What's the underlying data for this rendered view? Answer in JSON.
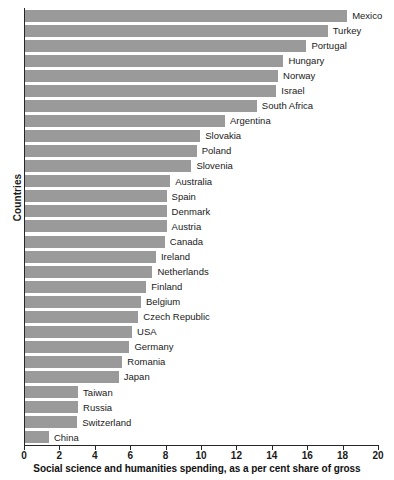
{
  "chart_data": {
    "type": "bar",
    "orientation": "horizontal",
    "title": "",
    "xlabel": "Social science and humanities spending, as a per cent share of gross",
    "ylabel": "Countries",
    "xlim": [
      0,
      20
    ],
    "xticks": [
      0,
      2,
      4,
      6,
      8,
      10,
      12,
      14,
      16,
      18,
      20
    ],
    "grid": false,
    "legend": false,
    "bar_color": "#9a9a9a",
    "axis_color": "#262626",
    "background": "#ffffff",
    "categories": [
      "Mexico",
      "Turkey",
      "Portugal",
      "Hungary",
      "Norway",
      "Israel",
      "South Africa",
      "Argentina",
      "Slovakia",
      "Poland",
      "Slovenia",
      "Australia",
      "Spain",
      "Denmark",
      "Austria",
      "Canada",
      "Ireland",
      "Netherlands",
      "Finland",
      "Belgium",
      "Czech Republic",
      "USA",
      "Germany",
      "Romania",
      "Japan",
      "Taiwan",
      "Russia",
      "Switzerland",
      "China"
    ],
    "values": [
      18.2,
      17.1,
      15.9,
      14.6,
      14.3,
      14.2,
      13.1,
      11.3,
      9.9,
      9.7,
      9.4,
      8.2,
      8.0,
      8.0,
      8.0,
      7.9,
      7.4,
      7.2,
      6.85,
      6.55,
      6.4,
      6.05,
      5.9,
      5.5,
      5.3,
      3.0,
      3.0,
      2.95,
      1.35
    ]
  }
}
